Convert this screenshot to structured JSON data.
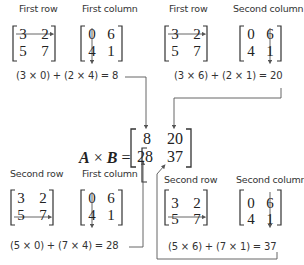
{
  "diagram": {
    "matrix_A": [
      [
        3,
        2
      ],
      [
        5,
        7
      ]
    ],
    "matrix_B": [
      [
        0,
        6
      ],
      [
        4,
        1
      ]
    ],
    "result_label": {
      "a": "A",
      "times": "×",
      "b": "B",
      "equals": "="
    },
    "result_matrix": [
      [
        8,
        20
      ],
      [
        28,
        37
      ]
    ],
    "panels": [
      {
        "row_label": "First row",
        "col_label": "First column",
        "A": [
          [
            "3",
            "2"
          ],
          [
            "5",
            "7"
          ]
        ],
        "B": [
          [
            "0",
            "6"
          ],
          [
            "4",
            "1"
          ]
        ],
        "equation": "(3 × 0) + (2 × 4) = 8"
      },
      {
        "row_label": "First row",
        "col_label": "Second column",
        "A": [
          [
            "3",
            "2"
          ],
          [
            "5",
            "7"
          ]
        ],
        "B": [
          [
            "0",
            "6"
          ],
          [
            "4",
            "1"
          ]
        ],
        "equation": "(3 × 6) + (2 × 1) = 20"
      },
      {
        "row_label": "Second row",
        "col_label": "First column",
        "A": [
          [
            "3",
            "2"
          ],
          [
            "5",
            "7"
          ]
        ],
        "B": [
          [
            "0",
            "6"
          ],
          [
            "4",
            "1"
          ]
        ],
        "equation": "(5 × 0) + (7 × 4) = 28"
      },
      {
        "row_label": "Second row",
        "col_label": "Second column",
        "A": [
          [
            "3",
            "2"
          ],
          [
            "5",
            "7"
          ]
        ],
        "B": [
          [
            "0",
            "6"
          ],
          [
            "4",
            "1"
          ]
        ],
        "equation": "(5 × 6) + (7 × 1) = 37"
      }
    ],
    "colors": {
      "text": "#222222",
      "line": "#555555",
      "background": "#ffffff"
    }
  }
}
